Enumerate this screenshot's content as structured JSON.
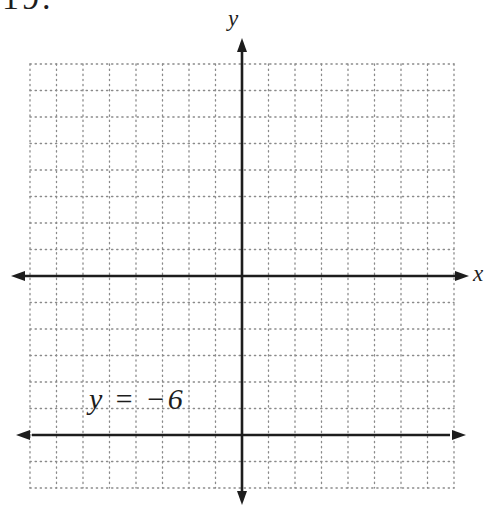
{
  "exercise": {
    "number": "19."
  },
  "figure": {
    "x_axis_label": "x",
    "y_axis_label": "y",
    "line_label": "y = −6"
  },
  "colors": {
    "axis": "#1d1d1d",
    "grid_dots": "#8a8a8a",
    "background": "#ffffff",
    "text": "#1d1d1d"
  },
  "chart_data": {
    "type": "line",
    "title": "",
    "xlabel": "x",
    "ylabel": "y",
    "equation": "y = −6",
    "x_range": [
      -8,
      8
    ],
    "y_range": [
      -8,
      8
    ],
    "grid": true,
    "grid_step": 1,
    "grid_style": "dotted",
    "axis_arrows": true,
    "ticks_labeled": false,
    "series": [
      {
        "name": "y = −6",
        "points": [
          [
            -8,
            -6
          ],
          [
            8,
            -6
          ]
        ],
        "arrows_both_ends": true
      }
    ]
  }
}
